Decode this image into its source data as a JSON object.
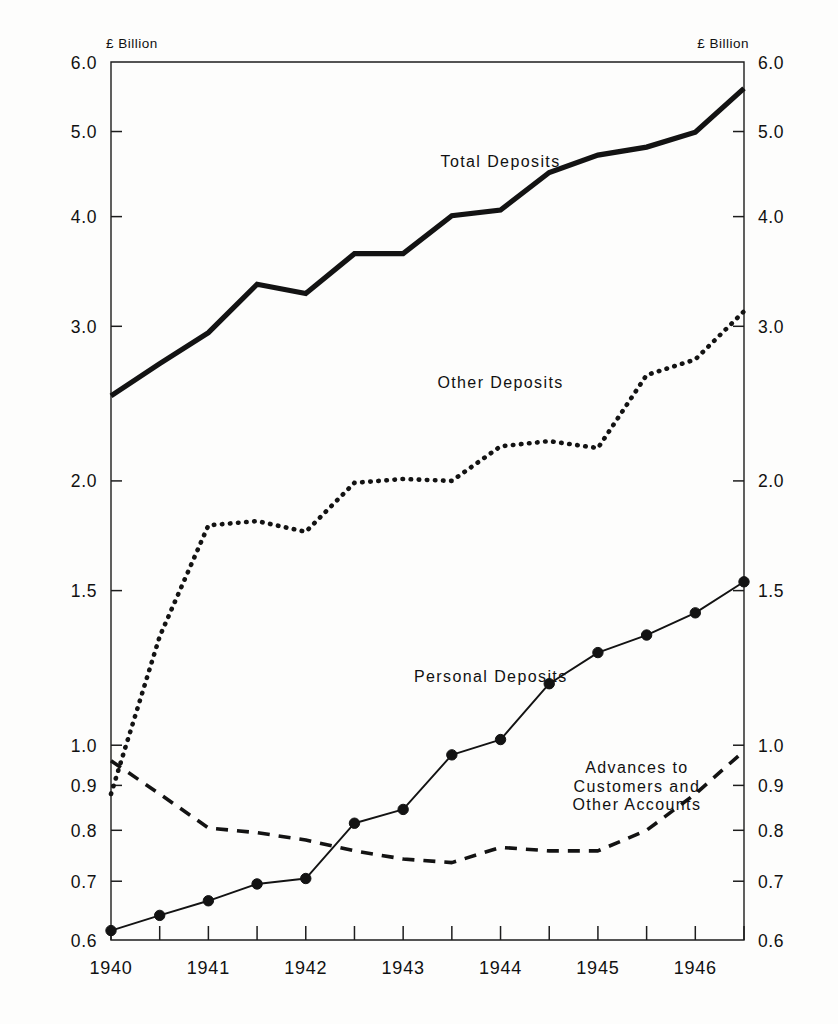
{
  "chart_data": {
    "type": "line",
    "title": "",
    "xlabel": "",
    "ylabel": "£ Billion",
    "unit_label_left": "£ Billion",
    "unit_label_right": "£ Billion",
    "yscale": "log",
    "ylim": [
      0.6,
      6.0
    ],
    "xlim": [
      1940.0,
      1946.5
    ],
    "grid": false,
    "legend": "inline-annotations",
    "ytick_labels": [
      "6.0",
      "5.0",
      "4.0",
      "3.0",
      "2.0",
      "1.5",
      "1.0",
      "0.9",
      "0.8",
      "0.7",
      "0.6"
    ],
    "ytick_values": [
      6.0,
      5.0,
      4.0,
      3.0,
      2.0,
      1.5,
      1.0,
      0.9,
      0.8,
      0.7,
      0.6
    ],
    "xtick_labels": [
      "1940",
      "1941",
      "1942",
      "1943",
      "1944",
      "1945",
      "1946"
    ],
    "xtick_values": [
      1940,
      1941,
      1942,
      1943,
      1944,
      1945,
      1946
    ],
    "x_minor_values": [
      1940.5,
      1941.5,
      1942.5,
      1943.5,
      1944.5,
      1945.5,
      1946.5
    ],
    "x": [
      1940.0,
      1940.5,
      1941.0,
      1941.5,
      1942.0,
      1942.5,
      1943.0,
      1943.5,
      1944.0,
      1944.5,
      1945.0,
      1945.5,
      1946.0,
      1946.5
    ],
    "series": [
      {
        "name": "Total Deposits",
        "style": "solid-thick",
        "markers": false,
        "values": [
          2.5,
          2.72,
          2.95,
          3.35,
          3.27,
          3.63,
          3.63,
          4.01,
          4.07,
          4.49,
          4.7,
          4.8,
          4.99,
          5.6
        ]
      },
      {
        "name": "Other Deposits",
        "style": "dotted",
        "markers": false,
        "values": [
          0.88,
          1.33,
          1.78,
          1.8,
          1.75,
          1.99,
          2.01,
          2.0,
          2.19,
          2.22,
          2.18,
          2.64,
          2.75,
          3.12
        ]
      },
      {
        "name": "Personal Deposits",
        "style": "solid-thin",
        "markers": true,
        "values": [
          0.615,
          0.64,
          0.665,
          0.695,
          0.705,
          0.815,
          0.845,
          0.975,
          1.015,
          1.175,
          1.275,
          1.335,
          1.415,
          1.535
        ]
      },
      {
        "name": "Advances to Customers and Other Accounts",
        "style": "dashed",
        "markers": false,
        "values": [
          0.96,
          0.88,
          0.805,
          0.795,
          0.78,
          0.758,
          0.742,
          0.735,
          0.765,
          0.758,
          0.758,
          0.8,
          0.88,
          0.985
        ]
      }
    ],
    "annotations": [
      {
        "id": "total-deposits-label",
        "text": "Total Deposits",
        "x": 1944.0,
        "y": 4.55
      },
      {
        "id": "other-deposits-label",
        "text": "Other Deposits",
        "x": 1944.0,
        "y": 2.55
      },
      {
        "id": "personal-deposits-label",
        "text": "Personal Deposits",
        "x": 1943.9,
        "y": 1.18
      },
      {
        "id": "advances-label-line1",
        "text": "Advances to",
        "x": 1945.4,
        "y": 0.93
      },
      {
        "id": "advances-label-line2",
        "text": "Customers and",
        "x": 1945.4,
        "y": 0.885
      },
      {
        "id": "advances-label-line3",
        "text": "Other Accounts",
        "x": 1945.4,
        "y": 0.843
      }
    ],
    "colors": {
      "line": "#131313",
      "axis": "#1d1d1d",
      "background": "#fdfdfc"
    }
  }
}
